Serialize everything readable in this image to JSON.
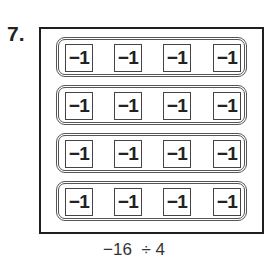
{
  "problem": {
    "number_label": "7.",
    "tile_value": "−1",
    "groups": [
      {
        "tiles": [
          "−1",
          "−1",
          "−1",
          "−1"
        ]
      },
      {
        "tiles": [
          "−1",
          "−1",
          "−1",
          "−1"
        ]
      },
      {
        "tiles": [
          "−1",
          "−1",
          "−1",
          "−1"
        ]
      },
      {
        "tiles": [
          "−1",
          "−1",
          "−1",
          "−1"
        ]
      }
    ],
    "group_count": 4,
    "tiles_per_group": 4,
    "total_tiles": 16,
    "expression": "−16  ÷ 4"
  }
}
